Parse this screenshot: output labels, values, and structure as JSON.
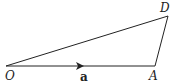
{
  "diagram": {
    "type": "vector-triangle",
    "points": {
      "O": {
        "label": "O",
        "x": 6,
        "y": 66
      },
      "A": {
        "label": "A",
        "x": 155,
        "y": 66
      },
      "D": {
        "label": "D",
        "x": 168,
        "y": 16
      }
    },
    "segments": [
      {
        "from": "O",
        "to": "A",
        "arrow": true,
        "vector_label": "a"
      },
      {
        "from": "O",
        "to": "D",
        "arrow": false
      },
      {
        "from": "A",
        "to": "D",
        "arrow": false
      }
    ],
    "labels": {
      "O": "O",
      "A": "A",
      "D": "D",
      "vector": "a"
    },
    "colors": {
      "line": "#222222",
      "background": "#ffffff"
    }
  }
}
